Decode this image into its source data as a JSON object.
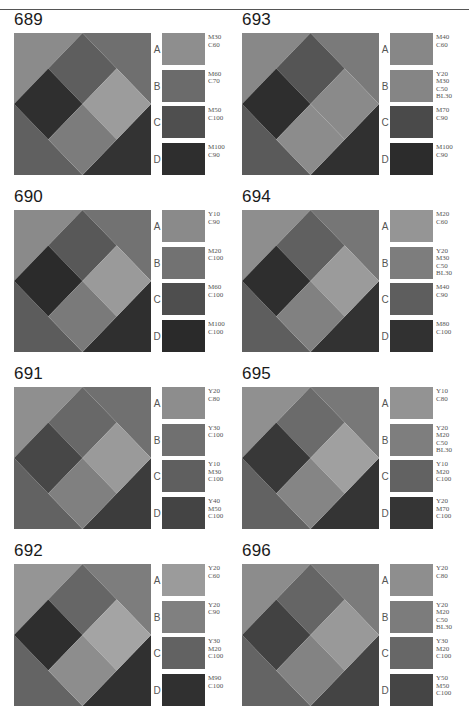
{
  "page": {
    "top_rule": true
  },
  "panels": [
    {
      "id": "689",
      "title": "689",
      "x": 10,
      "y": 10,
      "pattern": {
        "tl": "#8b8b8b",
        "tr": "#6f6f6f",
        "bl": "#606060",
        "br": "#333333",
        "top": "#5e5e5e",
        "left": "#2f2f2f",
        "right": "#9c9c9c",
        "bottom": "#7c7c7c"
      },
      "swatches": [
        {
          "letter": "A",
          "color": "#8e8e8e",
          "code": "M30\nC60"
        },
        {
          "letter": "B",
          "color": "#6b6b6b",
          "code": "M60\nC70"
        },
        {
          "letter": "C",
          "color": "#4f4f4f",
          "code": "M50\nC100"
        },
        {
          "letter": "D",
          "color": "#2e2e2e",
          "code": "M100\nC90"
        }
      ]
    },
    {
      "id": "693",
      "title": "693",
      "x": 238,
      "y": 10,
      "pattern": {
        "tl": "#888888",
        "tr": "#7a7a7a",
        "bl": "#5a5a5a",
        "br": "#303030",
        "top": "#555555",
        "left": "#2e2e2e",
        "right": "#8a8a8a",
        "bottom": "#8c8c8c"
      },
      "swatches": [
        {
          "letter": "A",
          "color": "#878787",
          "code": "M40\nC60"
        },
        {
          "letter": "B",
          "color": "#858585",
          "code": "Y20\nM30\nC50\nBL30"
        },
        {
          "letter": "C",
          "color": "#4a4a4a",
          "code": "M70\nC90"
        },
        {
          "letter": "D",
          "color": "#2c2c2c",
          "code": "M100\nC90"
        }
      ]
    },
    {
      "id": "690",
      "title": "690",
      "x": 10,
      "y": 187,
      "pattern": {
        "tl": "#8a8a8a",
        "tr": "#727272",
        "bl": "#5c5c5c",
        "br": "#2f2f2f",
        "top": "#585858",
        "left": "#2b2b2b",
        "right": "#9a9a9a",
        "bottom": "#7a7a7a"
      },
      "swatches": [
        {
          "letter": "A",
          "color": "#8a8a8a",
          "code": "Y10\nC90"
        },
        {
          "letter": "B",
          "color": "#727272",
          "code": "M20\nC100"
        },
        {
          "letter": "C",
          "color": "#4e4e4e",
          "code": "M60\nC100"
        },
        {
          "letter": "D",
          "color": "#2a2a2a",
          "code": "M100\nC100"
        }
      ]
    },
    {
      "id": "694",
      "title": "694",
      "x": 238,
      "y": 187,
      "pattern": {
        "tl": "#8e8e8e",
        "tr": "#767676",
        "bl": "#5e5e5e",
        "br": "#323232",
        "top": "#606060",
        "left": "#2e2e2e",
        "right": "#9b9b9b",
        "bottom": "#818181"
      },
      "swatches": [
        {
          "letter": "A",
          "color": "#959595",
          "code": "M20\nC60"
        },
        {
          "letter": "B",
          "color": "#7d7d7d",
          "code": "Y20\nM30\nC50\nBL30"
        },
        {
          "letter": "C",
          "color": "#5e5e5e",
          "code": "M40\nC90"
        },
        {
          "letter": "D",
          "color": "#313131",
          "code": "M80\nC100"
        }
      ]
    },
    {
      "id": "691",
      "title": "691",
      "x": 10,
      "y": 364,
      "pattern": {
        "tl": "#8f8f8f",
        "tr": "#707070",
        "bl": "#626262",
        "br": "#3c3c3c",
        "top": "#686868",
        "left": "#474747",
        "right": "#9a9a9a",
        "bottom": "#808080"
      },
      "swatches": [
        {
          "letter": "A",
          "color": "#8d8d8d",
          "code": "Y20\nC80"
        },
        {
          "letter": "B",
          "color": "#707070",
          "code": "Y30\nC100"
        },
        {
          "letter": "C",
          "color": "#5f5f5f",
          "code": "Y10\nM30\nC100"
        },
        {
          "letter": "D",
          "color": "#444444",
          "code": "Y40\nM50\nC100"
        }
      ]
    },
    {
      "id": "695",
      "title": "695",
      "x": 238,
      "y": 364,
      "pattern": {
        "tl": "#909090",
        "tr": "#787878",
        "bl": "#626262",
        "br": "#343434",
        "top": "#6b6b6b",
        "left": "#383838",
        "right": "#a0a0a0",
        "bottom": "#858585"
      },
      "swatches": [
        {
          "letter": "A",
          "color": "#939393",
          "code": "Y10\nC80"
        },
        {
          "letter": "B",
          "color": "#7e7e7e",
          "code": "Y20\nM20\nC50\nBL30"
        },
        {
          "letter": "C",
          "color": "#626262",
          "code": "Y10\nM20\nC100"
        },
        {
          "letter": "D",
          "color": "#353535",
          "code": "Y20\nM70\nC100"
        }
      ]
    },
    {
      "id": "692",
      "title": "692",
      "x": 10,
      "y": 541,
      "pattern": {
        "tl": "#959595",
        "tr": "#7d7d7d",
        "bl": "#646464",
        "br": "#303030",
        "top": "#666666",
        "left": "#2e2e2e",
        "right": "#a4a4a4",
        "bottom": "#8d8d8d"
      },
      "swatches": [
        {
          "letter": "A",
          "color": "#9b9b9b",
          "code": "Y20\nC60"
        },
        {
          "letter": "B",
          "color": "#808080",
          "code": "Y20\nC90"
        },
        {
          "letter": "C",
          "color": "#626262",
          "code": "Y30\nM20\nC100"
        },
        {
          "letter": "D",
          "color": "#303030",
          "code": "M90\nC100"
        }
      ]
    },
    {
      "id": "696",
      "title": "696",
      "x": 238,
      "y": 541,
      "pattern": {
        "tl": "#8c8c8c",
        "tr": "#7b7b7b",
        "bl": "#646464",
        "br": "#444444",
        "top": "#656565",
        "left": "#424242",
        "right": "#999999",
        "bottom": "#838383"
      },
      "swatches": [
        {
          "letter": "A",
          "color": "#8e8e8e",
          "code": "Y20\nC80"
        },
        {
          "letter": "B",
          "color": "#7c7c7c",
          "code": "Y20\nM20\nC50\nBL30"
        },
        {
          "letter": "C",
          "color": "#676767",
          "code": "Y30\nM20\nC100"
        },
        {
          "letter": "D",
          "color": "#454545",
          "code": "Y50\nM50\nC100"
        }
      ]
    }
  ]
}
